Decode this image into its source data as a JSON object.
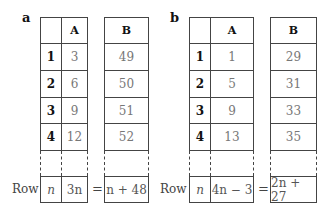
{
  "panels": [
    {
      "label": "a",
      "headers": {
        "index": "",
        "A": "A",
        "B": "B"
      },
      "rows": [
        {
          "index": "1",
          "A": "3",
          "B": "49"
        },
        {
          "index": "2",
          "A": "6",
          "B": "50"
        },
        {
          "index": "3",
          "A": "9",
          "B": "51"
        },
        {
          "index": "4",
          "A": "12",
          "B": "52"
        }
      ],
      "general": {
        "row_label": "Row",
        "index": "n",
        "A": "3n",
        "equals": "=",
        "B": "n + 48"
      }
    },
    {
      "label": "b",
      "headers": {
        "index": "",
        "A": "A",
        "B": "B"
      },
      "rows": [
        {
          "index": "1",
          "A": "1",
          "B": "29"
        },
        {
          "index": "2",
          "A": "5",
          "B": "31"
        },
        {
          "index": "3",
          "A": "9",
          "B": "33"
        },
        {
          "index": "4",
          "A": "13",
          "B": "35"
        }
      ],
      "general": {
        "row_label": "Row",
        "index": "n",
        "A": "4n − 3",
        "equals": "=",
        "B": "2n + 27"
      }
    }
  ]
}
